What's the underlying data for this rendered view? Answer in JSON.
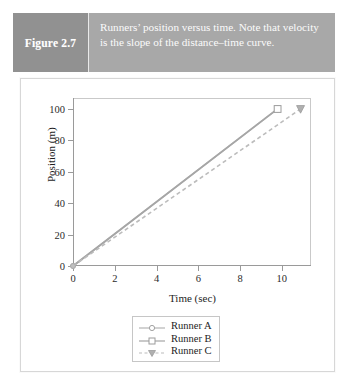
{
  "figure": {
    "label": "Figure 2.7",
    "caption": "Runners’ position versus time. Note that velocity is the slope of the distance–time curve.",
    "band_label_bg": "#919191",
    "band_caption_bg": "#a8a8a8",
    "band_text_color": "#ffffff"
  },
  "chart_data": {
    "type": "line",
    "title": "",
    "xlabel": "Time (sec)",
    "ylabel": "Position (m)",
    "xlim": [
      0,
      11.4
    ],
    "ylim": [
      0,
      107
    ],
    "xticks": [
      0,
      2,
      4,
      6,
      8,
      10
    ],
    "yticks": [
      0,
      20,
      40,
      60,
      80,
      100
    ],
    "xticklabels": [
      "0",
      "2",
      "4",
      "6",
      "8",
      "10"
    ],
    "yticklabels": [
      "0",
      "20",
      "40",
      "60",
      "80",
      "100"
    ],
    "grid": false,
    "legend_position": "below-axes-center",
    "series": [
      {
        "name": "Runner A",
        "marker": "circle",
        "linestyle": "solid",
        "color": "#b4b4b4",
        "x": [
          0,
          9.8
        ],
        "y": [
          0,
          100
        ]
      },
      {
        "name": "Runner B",
        "marker": "square",
        "linestyle": "solid",
        "color": "#a6a6a6",
        "x": [
          0,
          9.8
        ],
        "y": [
          0,
          100
        ]
      },
      {
        "name": "Runner C",
        "marker": "triangle-down",
        "linestyle": "dashed",
        "color": "#bcbcbc",
        "x": [
          0,
          10.9
        ],
        "y": [
          0,
          100
        ]
      }
    ]
  },
  "legend": {
    "items": [
      {
        "label": "Runner A",
        "marker": "circle",
        "linestyle": "solid",
        "color": "#b4b4b4"
      },
      {
        "label": "Runner B",
        "marker": "square",
        "linestyle": "solid",
        "color": "#a6a6a6"
      },
      {
        "label": "Runner C",
        "marker": "triangle-down",
        "linestyle": "dashed",
        "color": "#bcbcbc"
      }
    ]
  }
}
